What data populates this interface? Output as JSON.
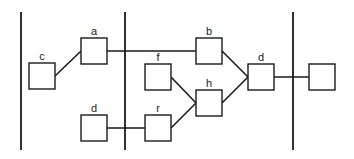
{
  "diagram": {
    "type": "network graph",
    "colors": {
      "stroke": "#1a1a1a",
      "background": "#ffffff"
    },
    "nodes": [
      {
        "id": "c",
        "label": "c"
      },
      {
        "id": "a",
        "label": "a"
      },
      {
        "id": "d1",
        "label": "d"
      },
      {
        "id": "f",
        "label": "f"
      },
      {
        "id": "r",
        "label": "r"
      },
      {
        "id": "b",
        "label": "b"
      },
      {
        "id": "h",
        "label": "h"
      },
      {
        "id": "d2",
        "label": "d"
      },
      {
        "id": "out",
        "label": ""
      }
    ],
    "edges": [
      {
        "from": "c",
        "to": "a"
      },
      {
        "from": "a",
        "to": "b"
      },
      {
        "from": "d1",
        "to": "r"
      },
      {
        "from": "f",
        "to": "h"
      },
      {
        "from": "r",
        "to": "h"
      },
      {
        "from": "b",
        "to": "d2"
      },
      {
        "from": "h",
        "to": "d2"
      },
      {
        "from": "d2",
        "to": "out"
      }
    ],
    "separators": 3
  }
}
